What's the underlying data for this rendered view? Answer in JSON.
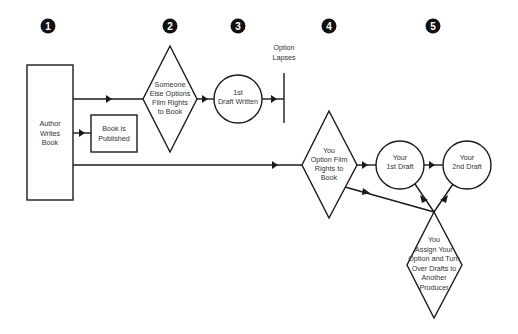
{
  "steps": [
    {
      "number": "1",
      "x": 48
    },
    {
      "number": "2",
      "x": 170
    },
    {
      "number": "3",
      "x": 238
    },
    {
      "number": "4",
      "x": 330
    },
    {
      "number": "5",
      "x": 433
    }
  ],
  "nodes": {
    "author": {
      "type": "rectangle",
      "lines": [
        "Author",
        "Writes",
        "Book"
      ]
    },
    "published": {
      "type": "rectangle",
      "lines": [
        "Book is",
        "Published"
      ]
    },
    "someone_else": {
      "type": "diamond",
      "lines": [
        "Someone",
        "Else Options",
        "Film Rights",
        "to Book"
      ]
    },
    "first_draft_written": {
      "type": "circle",
      "lines": [
        "1st",
        "Draft Written"
      ]
    },
    "option_lapses": {
      "type": "terminator",
      "lines": [
        "Option",
        "Lapses"
      ]
    },
    "you_option": {
      "type": "diamond",
      "lines": [
        "You",
        "Option Film",
        "Rights to",
        "Book"
      ]
    },
    "your_first_draft": {
      "type": "circle",
      "lines": [
        "Your",
        "1st Draft"
      ]
    },
    "your_second_draft": {
      "type": "circle",
      "lines": [
        "Your",
        "2nd Draft"
      ]
    },
    "assign": {
      "type": "diamond",
      "lines": [
        "You",
        "Assign Your",
        "Option and Turn",
        "Over Drafts to",
        "Another",
        "Producer"
      ]
    }
  },
  "edges": [
    {
      "from": "author",
      "to": "someone_else"
    },
    {
      "from": "author",
      "to": "published"
    },
    {
      "from": "author",
      "to": "you_option"
    },
    {
      "from": "someone_else",
      "to": "first_draft_written"
    },
    {
      "from": "first_draft_written",
      "to": "option_lapses"
    },
    {
      "from": "you_option",
      "to": "your_first_draft"
    },
    {
      "from": "your_first_draft",
      "to": "your_second_draft"
    },
    {
      "from": "you_option",
      "to": "assign"
    },
    {
      "from": "your_first_draft",
      "to": "assign"
    },
    {
      "from": "your_second_draft",
      "to": "assign"
    }
  ],
  "colors": {
    "line": "#1a1a1a",
    "text": "#333333",
    "badge": "#111111",
    "background": "#ffffff"
  }
}
